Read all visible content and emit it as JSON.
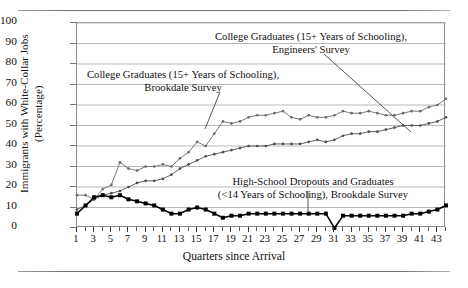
{
  "figure": {
    "y_axis_title": "Immigrants with White-Collar Jobs\n(Percentage)",
    "x_axis_title": "Quarters since Arrival"
  },
  "annotations": {
    "engineers": "College Graduates (15+ Years of Schooling),\nEngineers' Survey",
    "brookdale_college": "College Graduates (15+ Years of Schooling),\nBrookdale Survey",
    "highschool": "High-School Dropouts and Graduates\n(<14 Years of Schooling), Brookdale Survey"
  },
  "colors": {
    "axis": "#8d8d8d",
    "grid": "#b9b9b9",
    "series_engineers": "#6b6b6b",
    "series_brookdale_college": "#4f4f4f",
    "series_highschool": "#000000",
    "text": "#111111"
  },
  "chart_data": {
    "type": "line",
    "title": "",
    "xlabel": "Quarters since Arrival",
    "ylabel": "Immigrants with White-Collar Jobs (Percentage)",
    "xlim": [
      1,
      44
    ],
    "ylim": [
      0,
      100
    ],
    "yticks": [
      0,
      10,
      20,
      30,
      40,
      50,
      60,
      70,
      80,
      90,
      100
    ],
    "xticks": [
      1,
      3,
      5,
      7,
      9,
      11,
      13,
      15,
      17,
      19,
      21,
      23,
      25,
      27,
      29,
      31,
      33,
      35,
      37,
      39,
      41,
      43
    ],
    "x_all": [
      1,
      2,
      3,
      4,
      5,
      6,
      7,
      8,
      9,
      10,
      11,
      12,
      13,
      14,
      15,
      16,
      17,
      18,
      19,
      20,
      21,
      22,
      23,
      24,
      25,
      26,
      27,
      28,
      29,
      30,
      31,
      32,
      33,
      34,
      35,
      36,
      37,
      38,
      39,
      40,
      41,
      42,
      43,
      44
    ],
    "grid": true,
    "legend": "annotations-with-leader-lines",
    "series": [
      {
        "name": "College Graduates (15+ Years of Schooling), Engineers' Survey",
        "marker": "small-dot",
        "values": [
          16,
          16,
          14,
          19,
          21,
          32,
          29,
          28,
          30,
          30,
          31,
          30,
          34,
          37,
          42,
          40,
          46,
          52,
          51,
          52,
          54,
          55,
          55,
          56,
          57,
          54,
          53,
          55,
          54,
          54,
          55,
          57,
          56,
          56,
          57,
          56,
          55,
          55,
          56,
          57,
          57,
          59,
          60,
          63
        ]
      },
      {
        "name": "College Graduates (15+ Years of Schooling), Brookdale Survey",
        "marker": "small-dot",
        "values": [
          9,
          11,
          14,
          16,
          17,
          18,
          20,
          22,
          23,
          23,
          24,
          26,
          29,
          31,
          33,
          35,
          36,
          37,
          38,
          39,
          40,
          40,
          40,
          41,
          41,
          41,
          41,
          42,
          43,
          42,
          43,
          45,
          46,
          46,
          47,
          47,
          48,
          49,
          50,
          50,
          50,
          51,
          52,
          54
        ]
      },
      {
        "name": "High-School Dropouts and Graduates (<14 Years of Schooling), Brookdale Survey",
        "marker": "filled-square",
        "values": [
          7,
          11,
          15,
          16,
          15,
          16,
          14,
          13,
          12,
          11,
          9,
          7,
          7,
          9,
          10,
          9,
          7,
          5,
          6,
          6,
          7,
          7,
          7,
          7,
          7,
          7,
          7,
          7,
          7,
          7,
          0,
          6,
          6,
          6,
          6,
          6,
          6,
          6,
          6,
          7,
          7,
          8,
          9,
          11
        ]
      }
    ]
  }
}
